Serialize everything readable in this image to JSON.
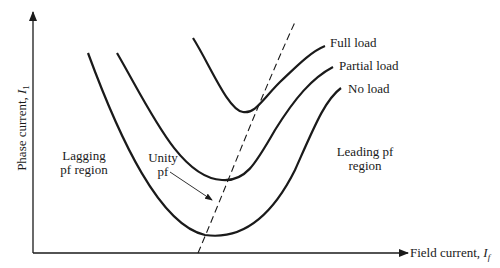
{
  "diagram": {
    "axes": {
      "x_label": "Field current, ",
      "x_symbol": "I",
      "x_subscript": "f",
      "y_label": "Phase current, ",
      "y_symbol": "I",
      "y_subscript": "1"
    },
    "curves": [
      {
        "name": "Full load",
        "label": "Full load"
      },
      {
        "name": "Partial load",
        "label": "Partial load"
      },
      {
        "name": "No load",
        "label": "No load"
      }
    ],
    "unity_pf": {
      "line1": "Unity",
      "line2": "pf"
    },
    "regions": {
      "lagging_line1": "Lagging",
      "lagging_line2": "pf region",
      "leading_line1": "Leading pf",
      "leading_line2": "region"
    },
    "colors": {
      "stroke": "#1a1a1a",
      "background": "#ffffff"
    }
  }
}
